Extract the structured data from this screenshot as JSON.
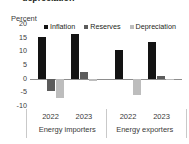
{
  "title": "depreciation",
  "unit_label": "Percent",
  "colors": {
    "inflation": "#131313",
    "reserves": "#5c5c5c",
    "depreciation": "#bdbdbd",
    "axis": "#8d8d8d",
    "separator": "#c9c9c9",
    "text": "#3a3a3a",
    "background": "#ffffff"
  },
  "chart_data": {
    "type": "bar",
    "title": "depreciation",
    "xlabel": "",
    "ylabel": "Percent",
    "ylim": [
      -10,
      20
    ],
    "yticks": [
      20,
      15,
      10,
      5,
      0,
      -5,
      -10
    ],
    "ytick_labels": [
      "20",
      "15",
      "10",
      "5",
      "0",
      "-5",
      "-10"
    ],
    "grid": false,
    "legend_position": "top",
    "categories": [
      "2022",
      "2023",
      "2022",
      "2023"
    ],
    "groups": [
      {
        "name": "Energy importers",
        "categories": [
          "2022",
          "2023"
        ]
      },
      {
        "name": "Energy exporters",
        "categories": [
          "2022",
          "2023"
        ]
      }
    ],
    "series": [
      {
        "name": "Inflation",
        "color": "#131313",
        "values": [
          15.3,
          16.5,
          10.4,
          13.3
        ]
      },
      {
        "name": "Reserves",
        "color": "#5c5c5c",
        "values": [
          -4.5,
          2.6,
          0.0,
          1.1
        ]
      },
      {
        "name": "Depreciation",
        "color": "#bdbdbd",
        "values": [
          -7.0,
          -0.9,
          -6.1,
          -0.5
        ]
      }
    ],
    "legend": [
      "Inflation",
      "Reserves",
      "Depreciation"
    ]
  },
  "axis": {
    "ticks": [
      {
        "label": "20",
        "value": 20
      },
      {
        "label": "15",
        "value": 15
      },
      {
        "label": "10",
        "value": 10
      },
      {
        "label": "5",
        "value": 5
      },
      {
        "label": "0",
        "value": 0
      },
      {
        "label": "-5",
        "value": -5
      },
      {
        "label": "-10",
        "value": -10
      }
    ]
  },
  "categories": {
    "years": [
      "2022",
      "2023",
      "2022",
      "2023"
    ],
    "group_labels": [
      "Energy importers",
      "Energy exporters"
    ]
  }
}
